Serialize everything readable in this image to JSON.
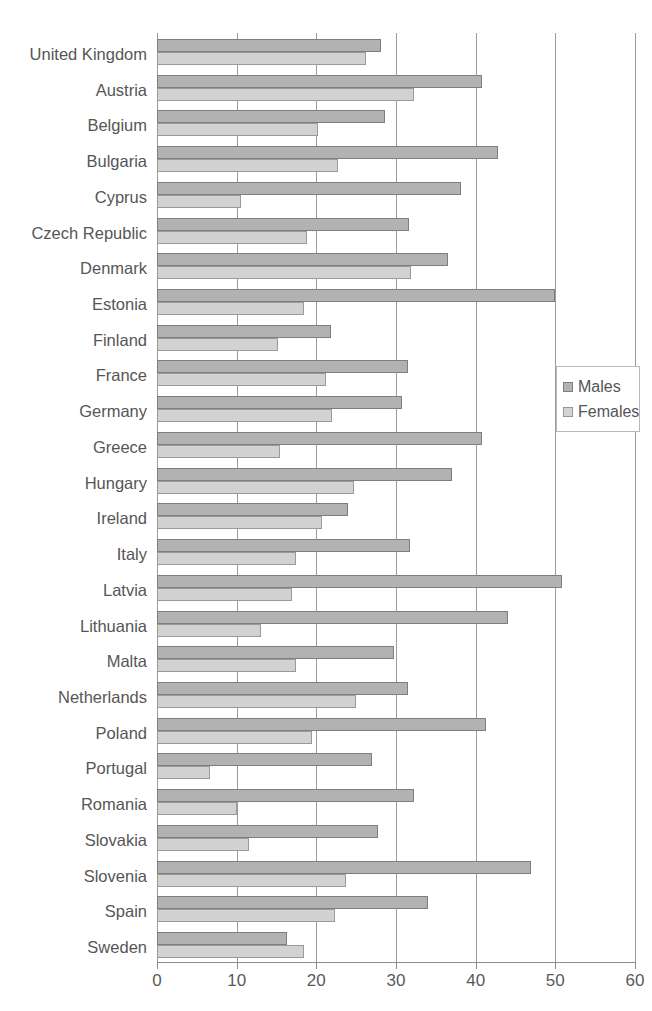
{
  "chart_data": {
    "type": "bar",
    "orientation": "horizontal",
    "title": "",
    "xlabel": "",
    "ylabel": "",
    "xlim": [
      0,
      60
    ],
    "xticks": [
      0,
      10,
      20,
      30,
      40,
      50,
      60
    ],
    "xtick_labels": [
      "0",
      "10",
      "20",
      "30",
      "40",
      "50",
      "60"
    ],
    "grid": "vertical",
    "legend_position": "right",
    "categories": [
      "United Kingdom",
      "Austria",
      "Belgium",
      "Bulgaria",
      "Cyprus",
      "Czech Republic",
      "Denmark",
      "Estonia",
      "Finland",
      "France",
      "Germany",
      "Greece",
      "Hungary",
      "Ireland",
      "Italy",
      "Latvia",
      "Lithuania",
      "Malta",
      "Netherlands",
      "Poland",
      "Portugal",
      "Romania",
      "Slovakia",
      "Slovenia",
      "Spain",
      "Sweden"
    ],
    "series": [
      {
        "name": "Males",
        "color": "#b2b2b2",
        "border": "#7e7e7e",
        "values": [
          28.1,
          40.8,
          28.6,
          42.8,
          38.2,
          31.6,
          36.5,
          50.0,
          21.8,
          31.5,
          30.8,
          40.8,
          37.0,
          24.0,
          31.8,
          50.8,
          44.1,
          29.8,
          31.5,
          41.3,
          27.0,
          32.3,
          27.8,
          47.0,
          34.0,
          16.3
        ]
      },
      {
        "name": "Females",
        "color": "#d2d2d2",
        "border": "#9a9a9a",
        "values": [
          26.2,
          32.3,
          20.2,
          22.7,
          10.5,
          18.8,
          31.9,
          18.5,
          15.2,
          21.2,
          22.0,
          15.5,
          24.7,
          20.7,
          17.5,
          17.0,
          13.0,
          17.5,
          25.0,
          19.5,
          6.7,
          10.0,
          11.5,
          23.7,
          22.3,
          18.5
        ]
      }
    ]
  },
  "legend": {
    "items": [
      {
        "label": "Males"
      },
      {
        "label": "Females"
      }
    ]
  },
  "title_fragment": ""
}
